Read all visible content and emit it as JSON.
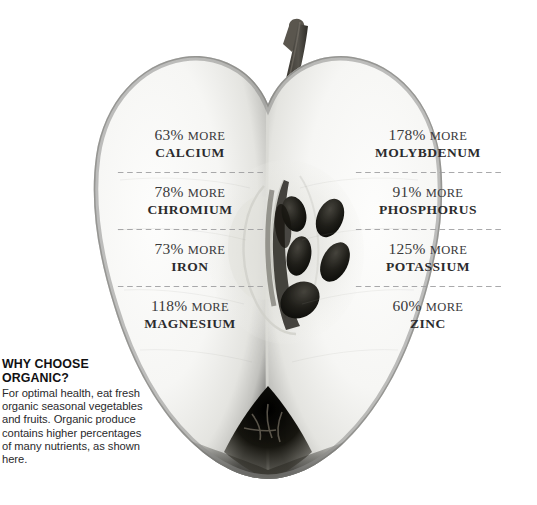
{
  "artwork": {
    "subject": "apple-cross-section",
    "description": "halved apple showing flesh, core and seeds",
    "stem": "apple-stem",
    "seeds": 5,
    "colors": {
      "flesh_light": "#fbfbfa",
      "flesh_mid": "#e9e9e6",
      "skin_rim": "#8e8e8c",
      "core_shadow": "#c9c9c5",
      "seed": "#1d1d1b",
      "stem": "#4a4742",
      "calyx": "#15140f"
    }
  },
  "nutrients": {
    "left_column": [
      {
        "amount": "63%",
        "unit": "MORE",
        "mineral": "CALCIUM"
      },
      {
        "amount": "78%",
        "unit": "MORE",
        "mineral": "CHROMIUM"
      },
      {
        "amount": "73%",
        "unit": "MORE",
        "mineral": "IRON"
      },
      {
        "amount": "118%",
        "unit": "MORE",
        "mineral": "MAGNESIUM"
      }
    ],
    "right_column": [
      {
        "amount": "178%",
        "unit": "MORE",
        "mineral": "MOLYBDENUM"
      },
      {
        "amount": "91%",
        "unit": "MORE",
        "mineral": "PHOSPHORUS"
      },
      {
        "amount": "125%",
        "unit": "MORE",
        "mineral": "POTASSIUM"
      },
      {
        "amount": "60%",
        "unit": "MORE",
        "mineral": "ZINC"
      }
    ]
  },
  "caption": {
    "heading": "WHY CHOOSE ORGANIC?",
    "body": "For optimal health, eat fresh organic seasonal vegetables and fruits. Organic produce contains higher percentages of many nutrients, as shown here."
  }
}
